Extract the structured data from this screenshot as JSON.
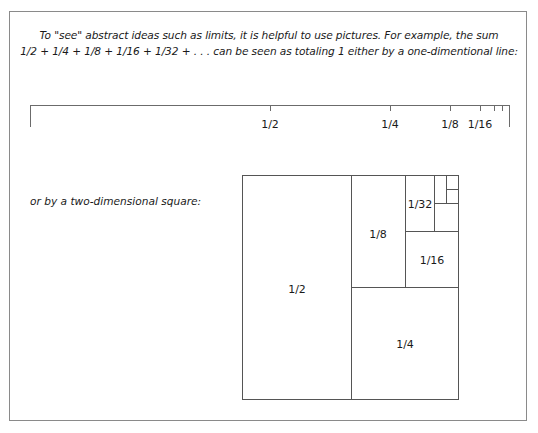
{
  "intro": {
    "line1": "To \"see\" abstract ideas such as limits, it is helpful to use pictures.  For example, the sum",
    "line2": "1/2 +  1/4  +  1/8 +  1/16  +  1/32 + . . . can be seen as totaling 1 either by a one-dimentional line:"
  },
  "number_line": {
    "labels": [
      "1/2",
      "1/4",
      "1/8",
      "1/16"
    ]
  },
  "square_intro": "or by a two-dimensional square:",
  "square": {
    "labels": [
      "1/2",
      "1/4",
      "1/8",
      "1/16",
      "1/32"
    ]
  },
  "colors": {
    "line": "#6b6b6b",
    "frame": "#8a8a8a",
    "text": "#1a1a1a"
  }
}
